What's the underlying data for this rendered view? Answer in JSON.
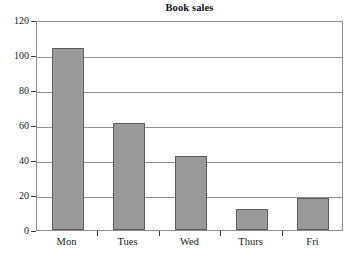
{
  "chart_data": {
    "type": "bar",
    "title": "Book sales",
    "xlabel": "",
    "ylabel": "",
    "categories": [
      "Mon",
      "Tues",
      "Wed",
      "Thurs",
      "Fri"
    ],
    "values": [
      104,
      61,
      42,
      12,
      18.5
    ],
    "ylim": [
      0,
      120
    ],
    "ytick_labels": [
      "0",
      "20",
      "40",
      "60",
      "80",
      "100",
      "120"
    ],
    "ytick_values": [
      0,
      20,
      40,
      60,
      80,
      100,
      120
    ],
    "grid": "horizontal",
    "legend": "none",
    "series": [
      {
        "name": "Book sales",
        "values": [
          104,
          61,
          42,
          12,
          18.5
        ]
      }
    ],
    "colors": {
      "bar_fill": "#9a9a9a",
      "bar_border": "#5c5c5c",
      "gridline": "#8f8f8f",
      "axis": "#8d8d8d",
      "background": "#ffffff",
      "text": "#1a1a1a"
    }
  }
}
